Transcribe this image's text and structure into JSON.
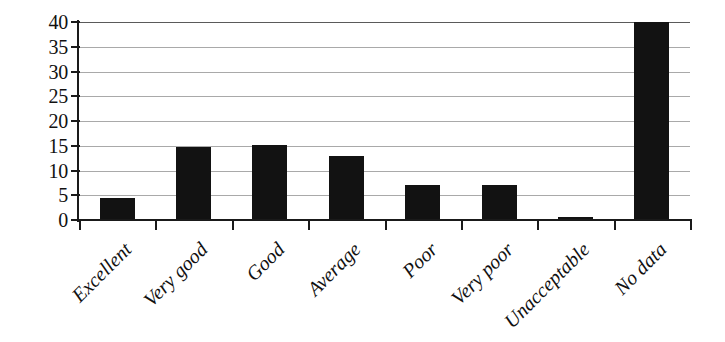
{
  "chart_data": {
    "type": "bar",
    "title": "",
    "subtitle": "",
    "xlabel": "",
    "ylabel": "",
    "categories": [
      "Excellent",
      "Very good",
      "Good",
      "Average",
      "Poor",
      "Very poor",
      "Unacceptable",
      "No data"
    ],
    "values": [
      4.4,
      14.7,
      15.1,
      13.0,
      7.0,
      7.0,
      0.6,
      40.0
    ],
    "ylim": [
      0,
      40
    ],
    "ytick_labels": [
      "0",
      "5",
      "10",
      "15",
      "20",
      "25",
      "30",
      "35",
      "40"
    ],
    "ytick_values": [
      0,
      5,
      10,
      15,
      20,
      25,
      30,
      35,
      40
    ],
    "grid": "horizontal",
    "legend": "none",
    "bar_color": "#121212",
    "grid_color": "#9a9a9a",
    "axis_color": "#1a1a1a",
    "background": "#ffffff",
    "annotations": []
  }
}
